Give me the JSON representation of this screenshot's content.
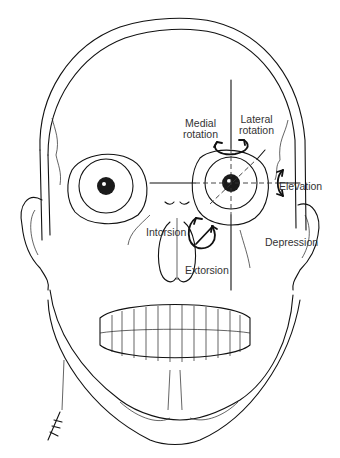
{
  "figure": {
    "labels": {
      "medial_rotation": "Medial\nrotation",
      "medial_rotation_l1": "Medial",
      "medial_rotation_l2": "rotation",
      "lateral_rotation_l1": "Lateral",
      "lateral_rotation_l2": "rotation",
      "elevation": "Elevation",
      "depression": "Depression",
      "intorsion": "Intorsion",
      "extorsion": "Extorsion"
    },
    "colors": {
      "line": "#111111",
      "text": "#333333",
      "background": "#ffffff"
    }
  }
}
